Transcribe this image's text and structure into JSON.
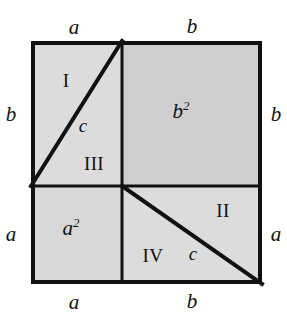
{
  "figure": {
    "colors": {
      "stroke": "#111111",
      "background": "#ffffff",
      "region_fill_light": "#dcdcdc",
      "region_fill_medium": "#d0d0d0",
      "b_square_fill": "#cfcfcf",
      "a_square_fill": "#d8d8d8"
    },
    "geometry": {
      "outer_square": {
        "x": 31,
        "y": 41,
        "width": 231,
        "height": 243
      },
      "cross_point": {
        "x": 122,
        "y": 186
      },
      "diagonal_upper_left": {
        "x1": 122,
        "y1": 41,
        "x2": 31,
        "y2": 186
      },
      "diagonal_lower_right": {
        "x1": 122,
        "y1": 186,
        "x2": 262,
        "y2": 284
      },
      "border_width": 4,
      "inner_line_width": 3,
      "diagonal_width": 4
    }
  },
  "edge_labels": {
    "top": [
      {
        "text": "a",
        "x": 74,
        "y": 17
      },
      {
        "text": "b",
        "x": 192,
        "y": 17
      }
    ],
    "left": [
      {
        "text": "b",
        "x": 7,
        "y": 105
      },
      {
        "text": "a",
        "x": 7,
        "y": 224
      }
    ],
    "right": [
      {
        "text": "b",
        "x": 270,
        "y": 105
      },
      {
        "text": "a",
        "x": 270,
        "y": 224
      }
    ],
    "bottom": [
      {
        "text": "a",
        "x": 74,
        "y": 292
      },
      {
        "text": "b",
        "x": 192,
        "y": 292
      }
    ]
  },
  "region_labels": [
    {
      "name": "region-I",
      "text": "I",
      "x": 66,
      "y": 71,
      "style": "roman"
    },
    {
      "name": "region-II",
      "text": "II",
      "x": 222,
      "y": 203,
      "style": "roman"
    },
    {
      "name": "region-III",
      "text": "III",
      "x": 93,
      "y": 155,
      "style": "roman"
    },
    {
      "name": "region-IV",
      "text": "IV",
      "x": 152,
      "y": 248,
      "style": "roman"
    },
    {
      "name": "hypotenuse-upper",
      "text": "c",
      "x": 83,
      "y": 117,
      "style": "var-sm"
    },
    {
      "name": "hypotenuse-lower",
      "text": "c",
      "x": 193,
      "y": 247,
      "style": "var-sm"
    }
  ],
  "area_labels": {
    "b_square": {
      "base": "b",
      "exponent": "2",
      "x": 178,
      "y": 104
    },
    "a_square": {
      "base": "a",
      "exponent": "2",
      "x": 68,
      "y": 221
    }
  }
}
